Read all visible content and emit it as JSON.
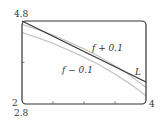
{
  "chart_data": {
    "type": "line",
    "title": "",
    "xlabel": "",
    "ylabel": "",
    "xlim": [
      2,
      4
    ],
    "ylim": [
      2.8,
      4.8
    ],
    "grid": false,
    "tick_labels": {
      "x_min": "2",
      "x_max": "4",
      "y_min": "2.8",
      "y_max": "4.8"
    },
    "x_ticks": [
      2.5,
      3.0,
      3.5
    ],
    "y_ticks": [
      3.8
    ],
    "series": [
      {
        "name": "L",
        "label": "L",
        "color": "#333333",
        "x": [
          2.0,
          4.0
        ],
        "y": [
          4.8,
          3.33
        ]
      },
      {
        "name": "f + 0.1",
        "label": "f + 0.1",
        "color": "#c8c8c8",
        "x": [
          2.0,
          2.25,
          2.5,
          2.75,
          3.0,
          3.25,
          3.5,
          3.75,
          4.0
        ],
        "y": [
          4.72,
          4.6,
          4.46,
          4.3,
          4.13,
          3.94,
          3.72,
          3.48,
          3.2
        ]
      },
      {
        "name": "f - 0.1",
        "label": "f − 0.1",
        "color": "#c8c8c8",
        "x": [
          2.0,
          2.25,
          2.5,
          2.75,
          3.0,
          3.25,
          3.5,
          3.75,
          4.0
        ],
        "y": [
          4.52,
          4.4,
          4.26,
          4.1,
          3.93,
          3.74,
          3.52,
          3.28,
          3.0
        ]
      }
    ],
    "annotations": [
      {
        "text": "f + 0.1",
        "x": 3.28,
        "y": 4.35
      },
      {
        "text": "f − 0.1",
        "x": 2.78,
        "y": 3.65
      },
      {
        "text": "L",
        "x": 3.85,
        "y": 3.55
      }
    ],
    "colors": {
      "frame": "#333333",
      "line_L": "#333333",
      "curves": "#c8c8c8",
      "background": "#ffffff"
    }
  }
}
